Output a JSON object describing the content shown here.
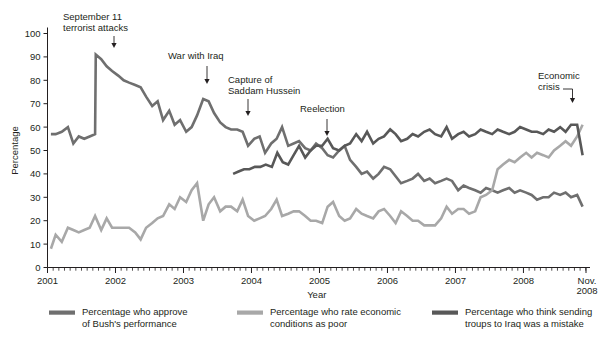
{
  "chart_data": {
    "type": "line",
    "title": "",
    "xlabel": "Year",
    "ylabel": "Percentage",
    "ylim": [
      0,
      100
    ],
    "xlim": [
      2001.0,
      2008.92
    ],
    "grid": false,
    "legend_position": "bottom",
    "y_ticks": [
      0,
      10,
      20,
      30,
      40,
      50,
      60,
      70,
      80,
      90,
      100
    ],
    "x_ticks": [
      2001,
      2002,
      2003,
      2004,
      2005,
      2006,
      2007,
      2008
    ],
    "x_tick_labels": [
      "2001",
      "2002",
      "2003",
      "2004",
      "2005",
      "2006",
      "2007",
      "2008"
    ],
    "x_end_label": "Nov.\n2008",
    "x_end_label_line1": "Nov.",
    "x_end_label_line2": "2008",
    "x_minor_ticks_per_year": 12,
    "series": [
      {
        "name": "Percentage who approve of Bush's performance",
        "color": "#6f6f6f",
        "x": [
          2001.05,
          2001.12,
          2001.21,
          2001.3,
          2001.38,
          2001.46,
          2001.54,
          2001.62,
          2001.7,
          2001.71,
          2001.79,
          2001.87,
          2001.95,
          2002.04,
          2002.12,
          2002.2,
          2002.29,
          2002.37,
          2002.45,
          2002.54,
          2002.62,
          2002.7,
          2002.79,
          2002.87,
          2002.95,
          2003.04,
          2003.12,
          2003.2,
          2003.29,
          2003.37,
          2003.45,
          2003.54,
          2003.62,
          2003.7,
          2003.79,
          2003.87,
          2003.95,
          2004.04,
          2004.12,
          2004.2,
          2004.29,
          2004.37,
          2004.45,
          2004.54,
          2004.62,
          2004.7,
          2004.79,
          2004.87,
          2004.95,
          2005.04,
          2005.12,
          2005.2,
          2005.29,
          2005.37,
          2005.45,
          2005.54,
          2005.62,
          2005.7,
          2005.79,
          2005.87,
          2005.95,
          2006.04,
          2006.12,
          2006.2,
          2006.29,
          2006.37,
          2006.45,
          2006.54,
          2006.62,
          2006.7,
          2006.79,
          2006.87,
          2006.95,
          2007.04,
          2007.12,
          2007.2,
          2007.29,
          2007.37,
          2007.45,
          2007.54,
          2007.62,
          2007.7,
          2007.79,
          2007.87,
          2007.95,
          2008.04,
          2008.12,
          2008.2,
          2008.29,
          2008.37,
          2008.45,
          2008.54,
          2008.62,
          2008.7,
          2008.79,
          2008.87
        ],
        "y": [
          57,
          57,
          58,
          60,
          53,
          56,
          55,
          56,
          57,
          91,
          89,
          86,
          84,
          82,
          80,
          79,
          78,
          77,
          73,
          69,
          71,
          63,
          67,
          61,
          63,
          58,
          60,
          65,
          72,
          71,
          66,
          62,
          60,
          59,
          59,
          58,
          52,
          55,
          56,
          49,
          53,
          55,
          60,
          52,
          53,
          54,
          51,
          50,
          53,
          51,
          48,
          47,
          50,
          52,
          46,
          43,
          40,
          41,
          38,
          40,
          43,
          42,
          39,
          36,
          37,
          38,
          40,
          37,
          38,
          36,
          37,
          38,
          37,
          33,
          35,
          34,
          33,
          32,
          34,
          33,
          32,
          33,
          34,
          32,
          33,
          32,
          31,
          29,
          30,
          30,
          32,
          31,
          32,
          30,
          31,
          26
        ],
        "legend_label_line1": "Percentage who approve",
        "legend_label_line2": "of Bush's performance"
      },
      {
        "name": "Percentage who rate economic conditions as poor",
        "color": "#a8a8a8",
        "x": [
          2001.05,
          2001.12,
          2001.21,
          2001.3,
          2001.38,
          2001.46,
          2001.54,
          2001.62,
          2001.7,
          2001.79,
          2001.87,
          2001.95,
          2002.04,
          2002.12,
          2002.2,
          2002.29,
          2002.37,
          2002.45,
          2002.54,
          2002.62,
          2002.7,
          2002.79,
          2002.87,
          2002.95,
          2003.04,
          2003.12,
          2003.2,
          2003.29,
          2003.37,
          2003.45,
          2003.54,
          2003.62,
          2003.7,
          2003.79,
          2003.87,
          2003.95,
          2004.04,
          2004.12,
          2004.2,
          2004.29,
          2004.37,
          2004.45,
          2004.54,
          2004.62,
          2004.7,
          2004.79,
          2004.87,
          2004.95,
          2005.04,
          2005.12,
          2005.2,
          2005.29,
          2005.37,
          2005.45,
          2005.54,
          2005.62,
          2005.7,
          2005.79,
          2005.87,
          2005.95,
          2006.04,
          2006.12,
          2006.2,
          2006.29,
          2006.37,
          2006.45,
          2006.54,
          2006.62,
          2006.7,
          2006.79,
          2006.87,
          2006.95,
          2007.04,
          2007.12,
          2007.2,
          2007.29,
          2007.37,
          2007.45,
          2007.54,
          2007.62,
          2007.7,
          2007.79,
          2007.87,
          2007.95,
          2008.04,
          2008.12,
          2008.2,
          2008.29,
          2008.37,
          2008.45,
          2008.54,
          2008.62,
          2008.7,
          2008.79,
          2008.87
        ],
        "y": [
          8,
          14,
          11,
          17,
          16,
          15,
          16,
          17,
          22,
          16,
          21,
          17,
          17,
          17,
          17,
          15,
          12,
          17,
          19,
          21,
          22,
          27,
          25,
          30,
          28,
          33,
          36,
          20,
          27,
          30,
          24,
          26,
          26,
          24,
          29,
          22,
          20,
          21,
          22,
          25,
          29,
          22,
          23,
          24,
          24,
          22,
          20,
          20,
          19,
          26,
          28,
          22,
          20,
          21,
          25,
          23,
          22,
          21,
          24,
          25,
          22,
          19,
          24,
          22,
          20,
          20,
          18,
          18,
          18,
          21,
          26,
          23,
          25,
          25,
          23,
          24,
          30,
          31,
          33,
          42,
          44,
          46,
          45,
          47,
          49,
          47,
          49,
          48,
          47,
          50,
          52,
          54,
          52,
          56,
          61
        ],
        "legend_label_line1": "Percentage who rate economic",
        "legend_label_line2": "conditions as poor"
      },
      {
        "name": "Percentage who think sending troups to Iraq was a mistake",
        "color": "#585858",
        "x": [
          2003.73,
          2003.81,
          2003.89,
          2003.97,
          2004.05,
          2004.13,
          2004.21,
          2004.3,
          2004.38,
          2004.46,
          2004.54,
          2004.62,
          2004.7,
          2004.79,
          2004.87,
          2004.95,
          2005.04,
          2005.12,
          2005.2,
          2005.29,
          2005.37,
          2005.45,
          2005.54,
          2005.62,
          2005.7,
          2005.79,
          2005.87,
          2005.95,
          2006.04,
          2006.12,
          2006.2,
          2006.29,
          2006.37,
          2006.45,
          2006.54,
          2006.62,
          2006.7,
          2006.79,
          2006.87,
          2006.95,
          2007.04,
          2007.12,
          2007.2,
          2007.29,
          2007.37,
          2007.45,
          2007.54,
          2007.62,
          2007.7,
          2007.79,
          2007.87,
          2007.95,
          2008.04,
          2008.12,
          2008.2,
          2008.29,
          2008.37,
          2008.45,
          2008.54,
          2008.62,
          2008.7,
          2008.79,
          2008.87
        ],
        "y": [
          40,
          41,
          42,
          42,
          43,
          43,
          44,
          43,
          49,
          45,
          44,
          48,
          52,
          47,
          50,
          52,
          52,
          55,
          51,
          50,
          52,
          53,
          57,
          54,
          58,
          53,
          55,
          56,
          59,
          57,
          54,
          55,
          57,
          56,
          58,
          59,
          57,
          56,
          60,
          55,
          57,
          58,
          56,
          57,
          59,
          58,
          57,
          59,
          58,
          57,
          58,
          60,
          59,
          58,
          58,
          57,
          59,
          58,
          60,
          58,
          61,
          61,
          48
        ],
        "legend_label_line1": "Percentage who think sending",
        "legend_label_line2": "troups to Iraq was a mistake"
      }
    ],
    "annotations": [
      {
        "id": "september-11",
        "label_line1": "September 11",
        "label_line2": "terrorist attacks",
        "target_x": 2001.7,
        "target_y": 91,
        "kind": "arrow-down"
      },
      {
        "id": "war-with-iraq",
        "label_line1": "War with Iraq",
        "label_line2": "",
        "target_x": 2003.29,
        "target_y": 72,
        "kind": "arrow-down"
      },
      {
        "id": "capture-of-saddam-hussein",
        "label_line1": "Capture of",
        "label_line2": "Saddam Hussein",
        "target_x": 2003.95,
        "target_y": 52,
        "kind": "arrow-down"
      },
      {
        "id": "reelection",
        "label_line1": "Reelection",
        "label_line2": "",
        "target_x": 2004.87,
        "target_y": 50,
        "kind": "arrow-down"
      },
      {
        "id": "economic-crisis",
        "label_line1": "Economic",
        "label_line2": "crisis",
        "target_x": 2008.79,
        "target_y": 61,
        "kind": "elbow-arrow-down"
      }
    ]
  },
  "colors": {
    "approve": "#6f6f6f",
    "economy": "#a8a8a8",
    "iraq": "#585858",
    "axis": "#231f20",
    "text": "#231f20",
    "background": "#ffffff"
  }
}
